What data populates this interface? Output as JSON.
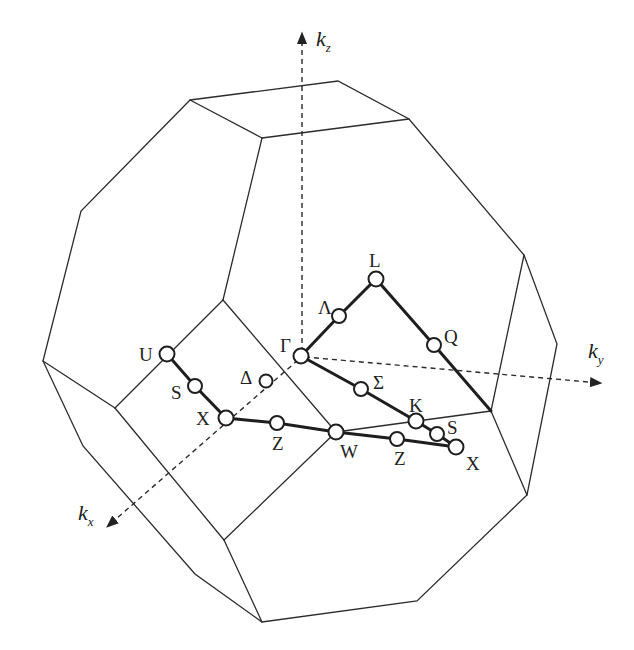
{
  "figure": {
    "colors": {
      "line": "#2b2b2b",
      "point_fill": "#ffffff",
      "background": "#ffffff"
    }
  },
  "axes": [
    {
      "id": "kz",
      "label": "k",
      "subscript": "z"
    },
    {
      "id": "ky",
      "label": "k",
      "subscript": "y"
    },
    {
      "id": "kx",
      "label": "k",
      "subscript": "x"
    }
  ],
  "points": [
    {
      "id": "gamma",
      "label": "Γ"
    },
    {
      "id": "lambda",
      "label": "Λ"
    },
    {
      "id": "L",
      "label": "L"
    },
    {
      "id": "Q",
      "label": "Q"
    },
    {
      "id": "sigma",
      "label": "Σ"
    },
    {
      "id": "K",
      "label": "K"
    },
    {
      "id": "S2",
      "label": "S"
    },
    {
      "id": "X2",
      "label": "X"
    },
    {
      "id": "Z2",
      "label": "Z"
    },
    {
      "id": "W",
      "label": "W"
    },
    {
      "id": "Z1",
      "label": "Z"
    },
    {
      "id": "X1",
      "label": "X"
    },
    {
      "id": "S1",
      "label": "S"
    },
    {
      "id": "U",
      "label": "U"
    },
    {
      "id": "delta",
      "label": "Δ"
    }
  ],
  "paths": [
    [
      "gamma",
      "lambda",
      "L",
      "Q",
      "X2"
    ],
    [
      "gamma",
      "sigma",
      "K",
      "S2",
      "X2"
    ],
    [
      "U",
      "S1",
      "X1",
      "Z1",
      "W",
      "Z2",
      "X2"
    ]
  ]
}
